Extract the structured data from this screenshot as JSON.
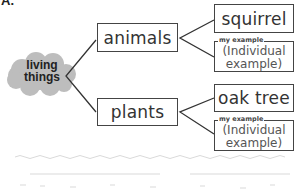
{
  "corner_label": "A.",
  "root": {
    "label_line1": "living",
    "label_line2": "things",
    "shape": "cloud",
    "fill": "#bdbdbd"
  },
  "categories": [
    {
      "label": "animals",
      "example": "squirrel",
      "my_example": {
        "tag": "my example",
        "line1": "(Individual",
        "line2": "example)"
      }
    },
    {
      "label": "plants",
      "example": "oak tree",
      "my_example": {
        "tag": "my example",
        "line1": "(Individual",
        "line2": "example)"
      }
    }
  ],
  "colors": {
    "border": "#444444",
    "cloud": "#bdbdbd",
    "text": "#333333"
  }
}
